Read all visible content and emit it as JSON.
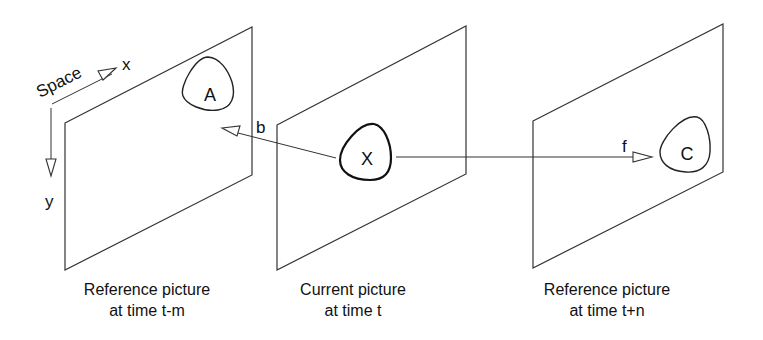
{
  "diagram": {
    "axes": {
      "space_label": "Space",
      "x_label": "x",
      "y_label": "y"
    },
    "pictures": [
      {
        "id": "ref-past",
        "caption_line1": "Reference picture",
        "caption_line2": "at time t-m",
        "object_label": "A"
      },
      {
        "id": "current",
        "caption_line1": "Current picture",
        "caption_line2": "at time t",
        "object_label": "X"
      },
      {
        "id": "ref-future",
        "caption_line1": "Reference picture",
        "caption_line2": "at time t+n",
        "object_label": "C"
      }
    ],
    "vectors": {
      "backward_label": "b",
      "forward_label": "f"
    },
    "colors": {
      "line": "#333333",
      "background": "#ffffff"
    }
  }
}
